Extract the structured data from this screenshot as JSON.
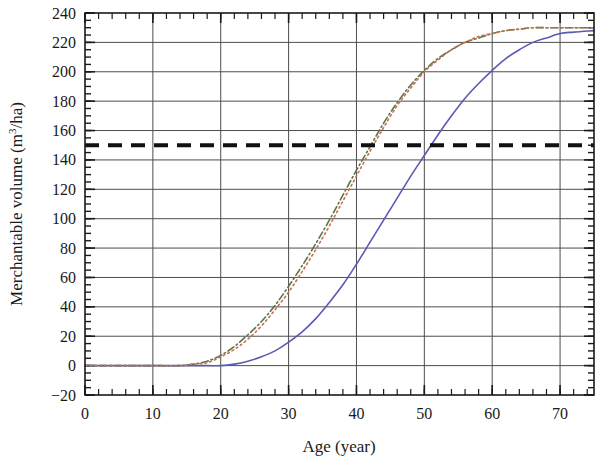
{
  "chart_data": {
    "type": "line",
    "title": "",
    "xlabel": "Age (year)",
    "ylabel_parts": {
      "before": "Merchantable volume (m",
      "sup": "3",
      "after": "/ha)"
    },
    "ylabel": "Merchantable volume (m3/ha)",
    "xlim": [
      0,
      75
    ],
    "ylim": [
      -20,
      240
    ],
    "xticks": [
      0,
      10,
      20,
      30,
      40,
      50,
      60,
      70
    ],
    "xtick_labels": [
      "0",
      "10",
      "20",
      "30",
      "40",
      "50",
      "60",
      "70"
    ],
    "yticks": [
      -20,
      0,
      20,
      40,
      60,
      80,
      100,
      120,
      140,
      160,
      180,
      200,
      220,
      240
    ],
    "ytick_labels": [
      "-20",
      "0",
      "20",
      "40",
      "60",
      "80",
      "100",
      "120",
      "140",
      "160",
      "180",
      "200",
      "220",
      "240"
    ],
    "x_minor_tick_step": 2,
    "y_minor_tick_step": 5,
    "grid": true,
    "grid_axis": "both",
    "legend": "none",
    "series": [
      {
        "name": "solid-blue-curve",
        "style": "solid",
        "color": "#5a5ab4",
        "width": 1.6,
        "x": [
          0,
          5,
          10,
          15,
          18,
          20,
          22,
          24,
          26,
          28,
          30,
          32,
          34,
          36,
          38,
          40,
          42,
          44,
          46,
          48,
          50,
          52,
          54,
          56,
          58,
          60,
          62,
          64,
          66,
          68,
          70,
          72,
          75
        ],
        "y": [
          0,
          0,
          0,
          0,
          0,
          0,
          1,
          3,
          6,
          10,
          16,
          23,
          32,
          43,
          55,
          69,
          84,
          99,
          114,
          129,
          143,
          157,
          170,
          182,
          192,
          201,
          209,
          215,
          220,
          223,
          226,
          227,
          228
        ]
      },
      {
        "name": "dashdot-green-curve",
        "style": "dashdot",
        "color": "#5f7348",
        "width": 1.6,
        "x": [
          0,
          5,
          10,
          14,
          16,
          18,
          20,
          22,
          24,
          26,
          28,
          30,
          32,
          34,
          36,
          38,
          40,
          42,
          44,
          46,
          48,
          50,
          52,
          54,
          56,
          58,
          60,
          62,
          64,
          66,
          68,
          70,
          72,
          75
        ],
        "y": [
          0,
          0,
          0,
          0,
          1,
          3,
          7,
          13,
          21,
          30,
          41,
          54,
          68,
          83,
          99,
          116,
          133,
          149,
          165,
          179,
          191,
          201,
          209,
          215,
          220,
          223,
          226,
          228,
          229,
          230,
          230,
          230,
          230,
          230
        ]
      },
      {
        "name": "dotted-red-curve",
        "style": "dotted",
        "color": "#c4704f",
        "width": 1.6,
        "x": [
          0,
          5,
          10,
          14,
          16,
          18,
          20,
          22,
          24,
          26,
          28,
          30,
          32,
          34,
          36,
          38,
          40,
          42,
          44,
          46,
          48,
          50,
          52,
          54,
          56,
          58,
          60,
          62,
          64,
          66,
          68,
          70,
          72,
          75
        ],
        "y": [
          0,
          0,
          0,
          0,
          1,
          2,
          6,
          11,
          18,
          27,
          38,
          50,
          64,
          79,
          95,
          112,
          129,
          146,
          162,
          177,
          189,
          200,
          208,
          215,
          220,
          224,
          226,
          228,
          229,
          230,
          230,
          230,
          230,
          230
        ]
      }
    ],
    "reference_lines": [
      {
        "name": "threshold-150",
        "orientation": "horizontal",
        "value": 150,
        "style": "dashed",
        "color": "#111111",
        "width": 4
      }
    ]
  }
}
